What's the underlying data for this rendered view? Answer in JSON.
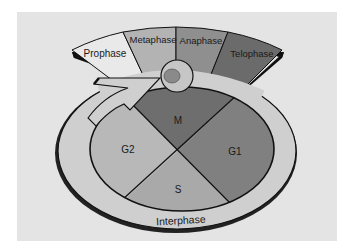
{
  "diagram": {
    "mitosis_phases": [
      {
        "label": "Prophase",
        "color": "#e9e9e9"
      },
      {
        "label": "Metaphase",
        "color": "#b3b3b3"
      },
      {
        "label": "Anaphase",
        "color": "#8f8f8f"
      },
      {
        "label": "Telophase",
        "color": "#6b6b6b"
      }
    ],
    "cycle_segments": [
      {
        "label": "M",
        "color": "#6e6e6e"
      },
      {
        "label": "G1",
        "color": "#808080"
      },
      {
        "label": "S",
        "color": "#a9a9a9"
      },
      {
        "label": "G2",
        "color": "#b8b8b8"
      }
    ],
    "outer_ring_label": "Interphase",
    "colors": {
      "background": "#ffffff",
      "panel": "#e4e4e4",
      "ring": "#cfcfcf",
      "outline": "#111111",
      "cell": "#c6c6c6",
      "nucleus": "#8a8a8a"
    }
  }
}
